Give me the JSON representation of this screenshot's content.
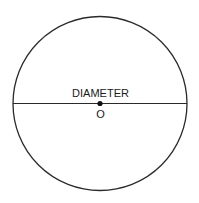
{
  "diagram": {
    "labels": {
      "diameter": "DIAMETER",
      "center": "O"
    },
    "circle": {
      "cx": 100,
      "cy": 103.5,
      "r": 87
    },
    "colors": {
      "stroke": "#2a2a2a",
      "background": "#ffffff"
    }
  }
}
